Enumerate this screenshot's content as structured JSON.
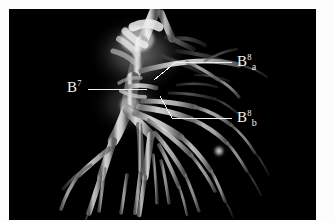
{
  "figure": {
    "kind": "ct-3d-bronchial-tree-rendering",
    "background_color": "#ffffff",
    "panel_color": "#000000",
    "panel": {
      "x": 9,
      "y": 9,
      "width": 307,
      "height": 211
    },
    "structure_color": "#d8d8d8",
    "leader_color": "#f0f0f0"
  },
  "annotations": [
    {
      "id": "b7",
      "base": "B",
      "superscript": "7",
      "subscript": "",
      "label_x": 67,
      "label_y": 80,
      "leader": {
        "x1": 88,
        "y1": 89,
        "x2": 147,
        "y2": 89
      }
    },
    {
      "id": "b8a",
      "base": "B",
      "superscript": "8",
      "subscript": "a",
      "label_x": 237,
      "label_y": 54,
      "leader": {
        "x1": 232,
        "y1": 63,
        "x2": 176,
        "y2": 62,
        "x3": 154,
        "y3": 80
      }
    },
    {
      "id": "b8b",
      "base": "B",
      "superscript": "8",
      "subscript": "b",
      "label_x": 237,
      "label_y": 110,
      "leader": {
        "x1": 232,
        "y1": 118,
        "x2": 172,
        "y2": 118,
        "x3": 160,
        "y3": 96
      }
    }
  ],
  "labels": {
    "b7_text": "B",
    "b7_sup": "7",
    "b8a_text": "B",
    "b8a_sup": "8",
    "b8a_sub": "a",
    "b8b_text": "B",
    "b8b_sup": "8",
    "b8b_sub": "b"
  }
}
